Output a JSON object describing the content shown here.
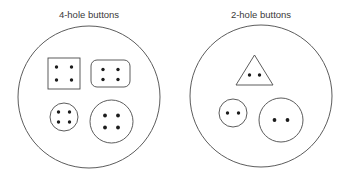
{
  "figure": {
    "type": "set-diagram",
    "background_color": "#ffffff",
    "line_color": "#4a4a4a",
    "hole_color": "#1c1c1c",
    "text_color": "#3a3a3a"
  },
  "groups": [
    {
      "id": "four-hole",
      "label": "4-hole buttons",
      "label_x": 89,
      "label_y": 18,
      "ring": {
        "cx": 89,
        "cy": 97,
        "r": 71
      },
      "hole_count": 4,
      "items": [
        {
          "id": "square-button",
          "shape": "square",
          "name": "square-button-4-holes",
          "x": 48,
          "y": 58,
          "width": 32,
          "height": 31,
          "rx": 0,
          "holes": [
            {
              "cx": 56.5,
              "cy": 67,
              "r": 1.7
            },
            {
              "cx": 71.5,
              "cy": 67,
              "r": 1.7
            },
            {
              "cx": 56.5,
              "cy": 80,
              "r": 1.7
            },
            {
              "cx": 71.5,
              "cy": 80,
              "r": 1.7
            }
          ]
        },
        {
          "id": "rounded-rect-button",
          "shape": "rounded-rect",
          "name": "rounded-rectangle-button-4-holes",
          "x": 91,
          "y": 60,
          "width": 39,
          "height": 27,
          "rx": 6,
          "holes": [
            {
              "cx": 103,
              "cy": 69.5,
              "r": 1.7
            },
            {
              "cx": 118,
              "cy": 69.5,
              "r": 1.7
            },
            {
              "cx": 103,
              "cy": 79.5,
              "r": 1.7
            },
            {
              "cx": 118,
              "cy": 79.5,
              "r": 1.7
            }
          ]
        },
        {
          "id": "small-round-button",
          "shape": "circle",
          "name": "small-round-button-4-holes",
          "cx": 64,
          "cy": 117,
          "r": 14,
          "holes": [
            {
              "cx": 58.5,
              "cy": 112,
              "r": 1.7
            },
            {
              "cx": 69.5,
              "cy": 112,
              "r": 1.7
            },
            {
              "cx": 58.5,
              "cy": 122,
              "r": 1.7
            },
            {
              "cx": 69.5,
              "cy": 122,
              "r": 1.7
            }
          ]
        },
        {
          "id": "large-round-button",
          "shape": "circle",
          "name": "large-round-button-4-holes",
          "cx": 111.5,
          "cy": 121.5,
          "r": 21.5,
          "holes": [
            {
              "cx": 105,
              "cy": 115.5,
              "r": 1.9
            },
            {
              "cx": 118,
              "cy": 115.5,
              "r": 1.9
            },
            {
              "cx": 105,
              "cy": 127.5,
              "r": 1.9
            },
            {
              "cx": 118,
              "cy": 127.5,
              "r": 1.9
            }
          ]
        }
      ]
    },
    {
      "id": "two-hole",
      "label": "2-hole buttons",
      "label_x": 261,
      "label_y": 18,
      "ring": {
        "cx": 261,
        "cy": 96,
        "r": 71
      },
      "hole_count": 2,
      "items": [
        {
          "id": "triangle-button",
          "shape": "triangle",
          "name": "triangle-button-2-holes",
          "points": "254.5,55 273,85 236,85",
          "holes": [
            {
              "cx": 249.5,
              "cy": 75,
              "r": 1.7
            },
            {
              "cx": 259.5,
              "cy": 75,
              "r": 1.7
            }
          ]
        },
        {
          "id": "small-round-button",
          "shape": "circle",
          "name": "small-round-button-2-holes",
          "cx": 233,
          "cy": 113,
          "r": 14,
          "holes": [
            {
              "cx": 227.5,
              "cy": 113,
              "r": 1.7
            },
            {
              "cx": 238.5,
              "cy": 113,
              "r": 1.7
            }
          ]
        },
        {
          "id": "large-round-button",
          "shape": "circle",
          "name": "large-round-button-2-holes",
          "cx": 281,
          "cy": 120,
          "r": 22,
          "holes": [
            {
              "cx": 274.5,
              "cy": 120,
              "r": 1.9
            },
            {
              "cx": 287.5,
              "cy": 120,
              "r": 1.9
            }
          ]
        }
      ]
    }
  ]
}
